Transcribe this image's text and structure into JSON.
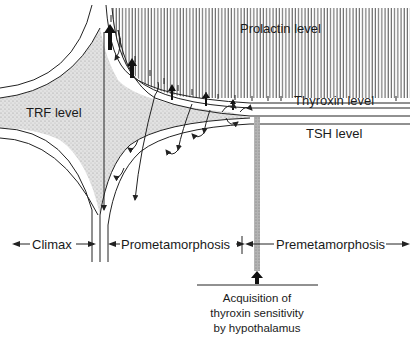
{
  "diagram": {
    "regions": {
      "prolactin": "Prolactin level",
      "thyroxin": "Thyroxin  level",
      "tsh": "TSH level",
      "trf": "TRF level"
    },
    "phases": {
      "climax": "Climax",
      "prometamorphosis": "Prometamorphosis",
      "premetamorphosis": "Premetamorphosis"
    },
    "annotation": {
      "line1": "Acquisition of",
      "line2": "thyroxin sensitivity",
      "line3": "by hypothalamus"
    },
    "colors": {
      "ink": "#1a1a1a",
      "stipple": "#d6d6d6",
      "hatch": "#555555",
      "bar": "#a8a8a8"
    }
  }
}
